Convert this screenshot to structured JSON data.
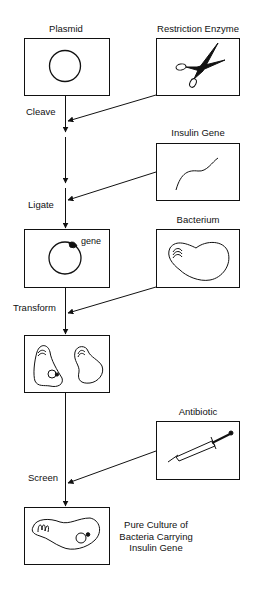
{
  "nodes": {
    "plasmid": {
      "label": "Plasmid"
    },
    "restriction_enzyme": {
      "label": "Restriction Enzyme"
    },
    "insulin_gene": {
      "label": "Insulin Gene"
    },
    "recombinant_plasmid": {
      "gene_label": "gene"
    },
    "bacterium": {
      "label": "Bacterium"
    },
    "antibiotic": {
      "label": "Antibiotic"
    },
    "result": {
      "line1": "Pure Culture of",
      "line2": "Bacteria Carrying",
      "line3": "Insulin Gene"
    }
  },
  "steps": {
    "cleave": "Cleave",
    "ligate": "Ligate",
    "transform": "Transform",
    "screen": "Screen"
  },
  "icons": {
    "plasmid": "circle-plasmid-icon",
    "restriction_enzyme": "scissors-icon",
    "insulin_gene": "dna-strand-icon",
    "recombinant_plasmid": "plasmid-with-gene-icon",
    "bacterium": "bacterium-icon",
    "transformed": "two-bacteria-icon",
    "antibiotic": "syringe-icon",
    "result": "bacterium-with-plasmid-icon"
  },
  "colors": {
    "ink": "#111111",
    "background": "#ffffff"
  }
}
